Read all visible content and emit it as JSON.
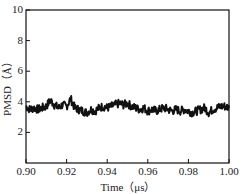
{
  "chart_data": {
    "type": "line",
    "title": "",
    "xlabel": "Time（μs）",
    "ylabel": "PMSD（Å）",
    "xlim": [
      0.9,
      1.0
    ],
    "ylim": [
      0,
      10
    ],
    "xticks": [
      "0.90",
      "0.92",
      "0.94",
      "0.96",
      "0.98",
      "1.00"
    ],
    "yticks": [
      "2",
      "4",
      "6",
      "8",
      "10"
    ],
    "grid": false,
    "legend": null,
    "series": [
      {
        "name": "PMSD",
        "color": "#111111",
        "x": [
          0.9,
          0.902,
          0.904,
          0.906,
          0.908,
          0.91,
          0.912,
          0.914,
          0.916,
          0.918,
          0.92,
          0.922,
          0.924,
          0.926,
          0.928,
          0.93,
          0.932,
          0.934,
          0.936,
          0.938,
          0.94,
          0.942,
          0.944,
          0.946,
          0.948,
          0.95,
          0.952,
          0.954,
          0.956,
          0.958,
          0.96,
          0.962,
          0.964,
          0.966,
          0.968,
          0.97,
          0.972,
          0.974,
          0.976,
          0.978,
          0.98,
          0.982,
          0.984,
          0.986,
          0.988,
          0.99,
          0.992,
          0.994,
          0.996,
          0.998,
          1.0
        ],
        "y": [
          3.7,
          3.5,
          3.6,
          3.5,
          3.6,
          3.7,
          4.1,
          3.8,
          3.6,
          3.8,
          3.7,
          4.2,
          3.6,
          3.5,
          3.4,
          3.3,
          3.5,
          3.4,
          3.6,
          3.7,
          3.6,
          3.7,
          3.8,
          3.9,
          3.8,
          3.9,
          3.7,
          3.6,
          3.5,
          3.6,
          3.4,
          3.5,
          3.4,
          3.5,
          3.6,
          3.5,
          3.4,
          3.5,
          3.4,
          3.5,
          3.4,
          3.3,
          3.4,
          3.5,
          3.6,
          3.3,
          3.5,
          3.6,
          3.7,
          3.7,
          3.6
        ]
      }
    ]
  }
}
